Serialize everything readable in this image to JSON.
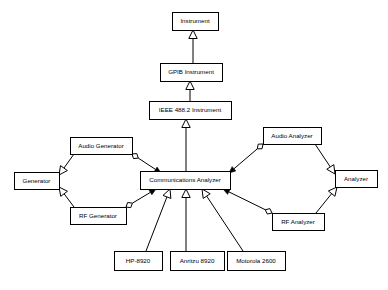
{
  "diagram": {
    "type": "uml-class-diagram",
    "background_color": "#ffffff",
    "line_color": "#000000",
    "box_fill_color": "#ffffff",
    "nodes": [
      {
        "id": "instrument",
        "label": "Instrument",
        "x": 172,
        "y": 12,
        "w": 46,
        "h": 18
      },
      {
        "id": "gpib",
        "label": "GPIB Instrument",
        "x": 160,
        "y": 63,
        "w": 62,
        "h": 18
      },
      {
        "id": "ieee",
        "label": "IEEE 488.2 Instrument",
        "x": 149,
        "y": 101,
        "w": 82,
        "h": 18
      },
      {
        "id": "comms",
        "label": "Communications Analyzer",
        "x": 140,
        "y": 171,
        "w": 90,
        "h": 18
      },
      {
        "id": "audiogen",
        "label": "Audio Generator",
        "x": 70,
        "y": 137,
        "w": 62,
        "h": 17
      },
      {
        "id": "generator",
        "label": "Generator",
        "x": 14,
        "y": 172,
        "w": 45,
        "h": 17
      },
      {
        "id": "rfgen",
        "label": "RF Generator",
        "x": 70,
        "y": 207,
        "w": 56,
        "h": 17
      },
      {
        "id": "audioanalyzer",
        "label": "Audio Analyzer",
        "x": 263,
        "y": 127,
        "w": 58,
        "h": 17
      },
      {
        "id": "analyzer",
        "label": "Analyzer",
        "x": 335,
        "y": 170,
        "w": 42,
        "h": 17
      },
      {
        "id": "rfanalyzer",
        "label": "RF Analyzer",
        "x": 272,
        "y": 213,
        "w": 52,
        "h": 17
      },
      {
        "id": "hp8920",
        "label": "HP-8920",
        "x": 114,
        "y": 251,
        "w": 48,
        "h": 19
      },
      {
        "id": "anritzu8920",
        "label": "Anritzu 8920",
        "x": 170,
        "y": 251,
        "w": 54,
        "h": 19
      },
      {
        "id": "motorola2600",
        "label": "Motorola 2600",
        "x": 227,
        "y": 251,
        "w": 58,
        "h": 19
      }
    ],
    "edges": [
      {
        "id": "e-gpib-instrument",
        "from": "gpib",
        "to": "instrument",
        "kind": "generalization",
        "points": [
          [
            193,
            63
          ],
          [
            193,
            30
          ]
        ]
      },
      {
        "id": "e-ieee-gpib",
        "from": "ieee",
        "to": "gpib",
        "kind": "generalization",
        "points": [
          [
            190,
            101
          ],
          [
            190,
            81
          ]
        ]
      },
      {
        "id": "e-comms-ieee",
        "from": "comms",
        "to": "ieee",
        "kind": "generalization",
        "points": [
          [
            186,
            171
          ],
          [
            186,
            119
          ]
        ]
      },
      {
        "id": "e-audiogen-generator",
        "from": "audiogen",
        "to": "generator",
        "kind": "generalization",
        "points": [
          [
            74,
            154
          ],
          [
            59,
            175
          ]
        ]
      },
      {
        "id": "e-rfgen-generator",
        "from": "rfgen",
        "to": "generator",
        "kind": "generalization",
        "points": [
          [
            74,
            207
          ],
          [
            59,
            187
          ]
        ]
      },
      {
        "id": "e-audioanalyzer-analyzer",
        "from": "audioanalyzer",
        "to": "analyzer",
        "kind": "generalization",
        "points": [
          [
            315,
            144
          ],
          [
            335,
            174
          ]
        ]
      },
      {
        "id": "e-rfanalyzer-analyzer",
        "from": "rfanalyzer",
        "to": "analyzer",
        "kind": "generalization",
        "points": [
          [
            316,
            213
          ],
          [
            337,
            187
          ]
        ]
      },
      {
        "id": "e-audiogen-comms",
        "from": "audiogen",
        "to": "comms",
        "kind": "aggregation",
        "points": [
          [
            132,
            154
          ],
          [
            161,
            173
          ]
        ]
      },
      {
        "id": "e-rfgen-comms",
        "from": "rfgen",
        "to": "comms",
        "kind": "aggregation",
        "points": [
          [
            126,
            207
          ],
          [
            156,
            189
          ]
        ]
      },
      {
        "id": "e-audioanalyzer-comms",
        "from": "audioanalyzer",
        "to": "comms",
        "kind": "aggregation",
        "points": [
          [
            263,
            144
          ],
          [
            229,
            173
          ]
        ]
      },
      {
        "id": "e-rfanalyzer-comms",
        "from": "rfanalyzer",
        "to": "comms",
        "kind": "aggregation",
        "points": [
          [
            272,
            213
          ],
          [
            223,
            189
          ]
        ]
      },
      {
        "id": "e-hp8920-comms",
        "from": "hp8920",
        "to": "comms",
        "kind": "generalization",
        "points": [
          [
            146,
            251
          ],
          [
            170,
            189
          ]
        ]
      },
      {
        "id": "e-anritzu-comms",
        "from": "anritzu8920",
        "to": "comms",
        "kind": "generalization",
        "points": [
          [
            186,
            251
          ],
          [
            186,
            189
          ]
        ]
      },
      {
        "id": "e-motorola-comms",
        "from": "motorola2600",
        "to": "comms",
        "kind": "generalization",
        "points": [
          [
            243,
            251
          ],
          [
            202,
            189
          ]
        ]
      }
    ]
  }
}
